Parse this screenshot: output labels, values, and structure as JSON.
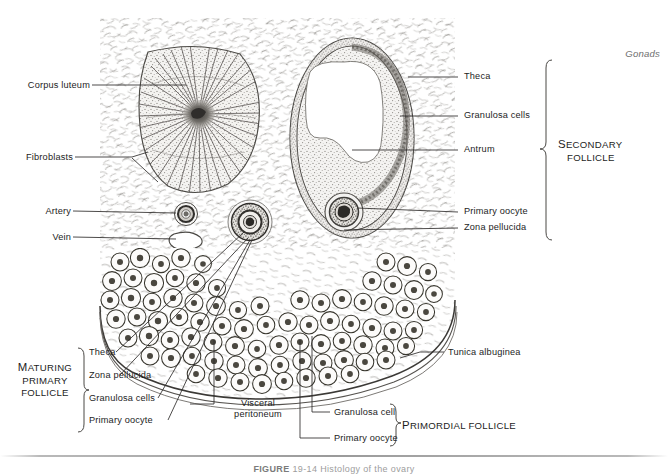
{
  "figure": {
    "header_note": "Gonads",
    "footer_caption_figure_word": "FIGURE",
    "footer_caption_rest": "19-14  Histology of the ovary"
  },
  "left_labels": [
    {
      "text": "Corpus luteum",
      "name": "label-corpus-luteum"
    },
    {
      "text": "Fibroblasts",
      "name": "label-fibroblasts"
    },
    {
      "text": "Artery",
      "name": "label-artery"
    },
    {
      "text": "Vein",
      "name": "label-vein"
    }
  ],
  "right_labels": [
    {
      "text": "Theca",
      "name": "label-theca"
    },
    {
      "text": "Granulosa cells",
      "name": "label-granulosa-cells"
    },
    {
      "text": "Antrum",
      "name": "label-antrum"
    },
    {
      "text": "Primary oocyte",
      "name": "label-primary-oocyte"
    },
    {
      "text": "Zona pellucida",
      "name": "label-zona-pellucida"
    }
  ],
  "secondary_follicle_group": {
    "line1": "Secondary",
    "line1_initial": "S",
    "line1_rest": "ECONDARY",
    "line2": "FOLLICLE"
  },
  "maturing_primary_follicle_group": {
    "line1_initial": "M",
    "line1_rest": "ATURING",
    "line2": "PRIMARY",
    "line3": "FOLLICLE",
    "items": [
      {
        "text": "Theca",
        "name": "label-mpf-theca"
      },
      {
        "text": "Zona pellucida",
        "name": "label-mpf-zona-pellucida"
      },
      {
        "text": "Granulosa cells",
        "name": "label-mpf-granulosa-cells"
      },
      {
        "text": "Primary oocyte",
        "name": "label-mpf-primary-oocyte"
      }
    ]
  },
  "primordial_follicle_group": {
    "title_initial": "P",
    "title_rest": "RIMORDIAL FOLLICLE",
    "items": [
      {
        "text": "Granulosa cell",
        "name": "label-pf-granulosa-cell"
      },
      {
        "text": "Primary oocyte",
        "name": "label-pf-primary-oocyte"
      }
    ]
  },
  "other_labels": [
    {
      "text": "Tunica albuginea",
      "name": "label-tunica-albuginea"
    },
    {
      "text": "Visceral",
      "name": "label-visceral-peritoneum-line1"
    },
    {
      "text": "peritoneum",
      "name": "label-visceral-peritoneum-line2"
    }
  ],
  "colors": {
    "background": "#ffffff",
    "ink": "#1d1d1d",
    "leader_line": "#3a3a3a",
    "tissue_light": "#efeeec",
    "tissue_mid": "#cfcdc9",
    "tissue_dark": "#8e8b86",
    "header_note": "#6e6e6e"
  }
}
